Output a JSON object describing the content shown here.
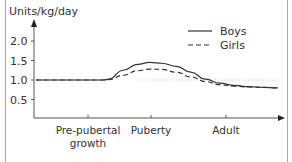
{
  "chart_data": {
    "type": "line",
    "title": "",
    "ylabel": "Units/kg/day",
    "xlabel": "",
    "ylim": [
      0,
      2.4
    ],
    "yticks": [
      {
        "value": 0.5,
        "label": "0.5"
      },
      {
        "value": 1.0,
        "label": "1.0"
      },
      {
        "value": 1.5,
        "label": "1.5"
      },
      {
        "value": 2.0,
        "label": "2.0"
      }
    ],
    "xticks": [
      {
        "label_lines": [
          "Pre-pubertal",
          "growth"
        ],
        "x": 0.22
      },
      {
        "label_lines": [
          "Puberty"
        ],
        "x": 0.47
      },
      {
        "label_lines": [
          "Adult"
        ],
        "x": 0.78
      }
    ],
    "reference_line": {
      "value": 1.0,
      "style": "dotted"
    },
    "legend": {
      "position": "upper right",
      "entries": [
        "Boys",
        "Girls"
      ]
    },
    "grid": false,
    "series": [
      {
        "name": "Boys",
        "style": "solid",
        "x": [
          0.0,
          0.1,
          0.2,
          0.28,
          0.3,
          0.36,
          0.42,
          0.47,
          0.52,
          0.58,
          0.64,
          0.7,
          0.76,
          0.82,
          0.88,
          0.94,
          1.0
        ],
        "values": [
          1.0,
          1.0,
          1.0,
          1.0,
          1.02,
          1.25,
          1.4,
          1.45,
          1.43,
          1.35,
          1.2,
          1.02,
          0.92,
          0.86,
          0.83,
          0.81,
          0.8
        ]
      },
      {
        "name": "Girls",
        "style": "dashed",
        "x": [
          0.0,
          0.1,
          0.2,
          0.28,
          0.3,
          0.36,
          0.42,
          0.47,
          0.52,
          0.58,
          0.64,
          0.7,
          0.76,
          0.82,
          0.88,
          0.94,
          1.0
        ],
        "values": [
          1.0,
          1.0,
          1.0,
          1.0,
          1.01,
          1.12,
          1.24,
          1.28,
          1.27,
          1.2,
          1.08,
          0.96,
          0.88,
          0.84,
          0.82,
          0.81,
          0.8
        ]
      }
    ]
  },
  "colors": {
    "axis": "#555555",
    "series": "#333333",
    "reference": "#bbbbbb",
    "text": "#333333",
    "frame": "#a9a9a9"
  }
}
